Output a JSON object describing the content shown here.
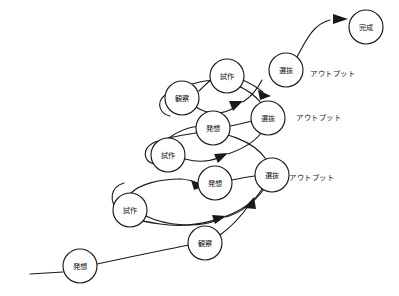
{
  "diagram": {
    "background_color": "#ffffff",
    "line_color": "#1a1a1a",
    "node_fill": "#ffffff",
    "nodes": [
      {
        "id": "n1",
        "label": "発想",
        "cx": 80,
        "cy": 266,
        "r": 17,
        "cycle": 0,
        "stage": "ideation"
      },
      {
        "id": "n2",
        "label": "観察",
        "cx": 205,
        "cy": 243,
        "r": 17,
        "cycle": 1,
        "stage": "observation"
      },
      {
        "id": "n3",
        "label": "試作",
        "cx": 130,
        "cy": 210,
        "r": 17,
        "cycle": 1,
        "stage": "prototype"
      },
      {
        "id": "n4",
        "label": "発想",
        "cx": 215,
        "cy": 183,
        "r": 17,
        "cycle": 1,
        "stage": "ideation"
      },
      {
        "id": "n5",
        "label": "選抜",
        "cx": 272,
        "cy": 175,
        "r": 17,
        "cycle": 1,
        "stage": "selection"
      },
      {
        "id": "n6",
        "label": "試作",
        "cx": 168,
        "cy": 155,
        "r": 17,
        "cycle": 2,
        "stage": "prototype"
      },
      {
        "id": "n7",
        "label": "発想",
        "cx": 213,
        "cy": 128,
        "r": 17,
        "cycle": 2,
        "stage": "ideation"
      },
      {
        "id": "n8",
        "label": "選抜",
        "cx": 268,
        "cy": 118,
        "r": 17,
        "cycle": 2,
        "stage": "selection"
      },
      {
        "id": "n9",
        "label": "観察",
        "cx": 182,
        "cy": 98,
        "r": 17,
        "cycle": 3,
        "stage": "observation"
      },
      {
        "id": "n10",
        "label": "試作",
        "cx": 227,
        "cy": 76,
        "r": 17,
        "cycle": 3,
        "stage": "prototype"
      },
      {
        "id": "n11",
        "label": "選抜",
        "cx": 286,
        "cy": 70,
        "r": 17,
        "cycle": 3,
        "stage": "selection"
      },
      {
        "id": "n12",
        "label": "完成",
        "cx": 366,
        "cy": 27,
        "r": 17,
        "cycle": 4,
        "stage": "completion"
      }
    ],
    "output_labels": [
      {
        "id": "o1",
        "text": "アウトプット",
        "x": 310,
        "y": 73
      },
      {
        "id": "o2",
        "text": "アウトプット",
        "x": 296,
        "y": 117
      },
      {
        "id": "o3",
        "text": "アウトプット",
        "x": 289,
        "y": 177
      }
    ],
    "edges": [
      {
        "id": "e-start",
        "from": "entry",
        "to": "n1",
        "d": "M 30 274 L 63 272",
        "arrow": false
      },
      {
        "id": "e1",
        "from": "n1",
        "to": "n2",
        "d": "M 97 264 C 130 258, 165 250, 188 246",
        "arrow": false
      },
      {
        "id": "e2",
        "from": "n2",
        "to": "n5",
        "d": "M 220 236 C 232 229, 240 221, 250 207",
        "arrow": true,
        "tip": [
          253,
          201
        ],
        "angle": -55
      },
      {
        "id": "e3",
        "from": "n5",
        "to": "n3",
        "d": "M 261 188 C 235 214, 185 226, 147 216",
        "arrow": false
      },
      {
        "id": "e3b",
        "from": "n5-loop",
        "to": "n3",
        "d": "M 120 196 C 102 186, 105 167, 125 163",
        "arrow": false
      },
      {
        "id": "e4",
        "from": "n3",
        "to": "n4",
        "d": "M 147 207 C 170 204, 192 198, 205 191",
        "arrow": true,
        "tip": [
          209,
          188
        ],
        "angle": -24
      },
      {
        "id": "e5",
        "from": "n4",
        "to": "n5",
        "d": "M 232 179 C 243 177, 252 176, 256 175",
        "arrow": false
      },
      {
        "id": "e6",
        "from": "n5",
        "to": "n6",
        "d": "M 264 159 C 248 140, 210 130, 186 140",
        "arrow": false
      },
      {
        "id": "e6b",
        "from": "loop2",
        "to": "n6",
        "d": "M 155 143 C 142 137, 145 122, 160 120",
        "arrow": false
      },
      {
        "id": "e7",
        "from": "n6",
        "to": "n7",
        "d": "M 185 152 C 192 146, 200 138, 205 134",
        "arrow": false
      },
      {
        "id": "e8",
        "from": "n7",
        "to": "n8",
        "d": "M 230 125 C 240 123, 247 121, 252 120",
        "arrow": false
      },
      {
        "id": "e9",
        "from": "n8",
        "to": "n9",
        "d": "M 259 104 C 240 88, 216 82, 198 89",
        "arrow": false
      },
      {
        "id": "e10",
        "from": "n9",
        "to": "n10",
        "d": "M 198 91 C 207 85, 214 80, 210 80",
        "arrow": false
      },
      {
        "id": "e11",
        "from": "n10",
        "to": "n11",
        "d": "M 244 79 C 254 83, 262 87, 268 91",
        "arrow": true,
        "tip": [
          272,
          94
        ],
        "angle": 38
      },
      {
        "id": "e12",
        "from": "n11",
        "to": "n12",
        "d": "M 296 56 C 310 36, 318 22, 344 20",
        "arrow": true,
        "tip": [
          348,
          20
        ],
        "angle": -6
      },
      {
        "id": "e13",
        "from": "n9",
        "to": "loop3",
        "d": "M 193 110 C 206 120, 226 120, 240 109",
        "arrow": true,
        "tip": [
          244,
          106
        ],
        "angle": -38
      },
      {
        "id": "e14",
        "from": "n6",
        "to": "loop2",
        "d": "M 185 160 C 198 163, 212 163, 222 159",
        "arrow": true,
        "tip": [
          227,
          157
        ],
        "angle": -22
      },
      {
        "id": "e15",
        "from": "n3",
        "to": "loop1",
        "d": "M 147 215 C 170 223, 198 224, 215 219",
        "arrow": true,
        "tip": [
          220,
          217
        ],
        "angle": -17
      }
    ],
    "flow_description": "A widening spiral of iterative cycles: 発想 → 観察 → 試作 → 発想 → 選抜 with アウトプット at each 選抜, converging on 完成."
  }
}
